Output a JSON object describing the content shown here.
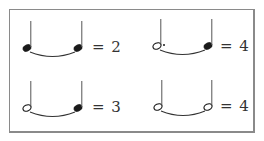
{
  "examples": [
    {
      "id": "tl",
      "first_note": "quarter",
      "second_note": "quarter",
      "equation": "= 2",
      "total_beats": 2
    },
    {
      "id": "tr",
      "first_note": "dotted-half",
      "second_note": "quarter",
      "equation": "= 4",
      "total_beats": 4
    },
    {
      "id": "bl",
      "first_note": "half",
      "second_note": "quarter",
      "equation": "= 3",
      "total_beats": 3
    },
    {
      "id": "br",
      "first_note": "half",
      "second_note": "half",
      "equation": "= 4",
      "total_beats": 4
    }
  ],
  "colors": {
    "ink": "#1a1a1a",
    "frame": "#8a8a8a"
  }
}
